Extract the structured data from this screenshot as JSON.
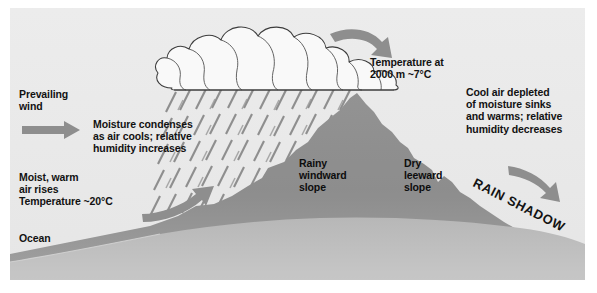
{
  "figure": {
    "background_color": "#ffffff",
    "panel_color": "#eeeeee",
    "mountain_color": "#8f8f8f",
    "foreground_color": "#b4b4b4",
    "arrow_color": "#8c8c8c",
    "cloud_color": "#fdfdfd",
    "rain_color": "#7d7d7d",
    "text_color": "#121212"
  },
  "labels": {
    "prevailing_wind": "Prevailing\nwind",
    "moisture_condenses": "Moisture condenses\nas air cools; relative\nhumidity increases",
    "moist_warm_air": "Moist, warm\nair rises\nTemperature ~20°C",
    "ocean": "Ocean",
    "temperature_2000m": "Temperature at\n2000 m ~7°C",
    "cool_air_depleted": "Cool air depleted\nof moisture sinks\nand warms; relative\nhumidity decreases",
    "rainy_windward_slope": "Rainy\nwindward\nslope",
    "dry_leeward_slope": "Dry\nleeward\nslope",
    "rain_shadow": "RAIN SHADOW"
  },
  "icons": {
    "wind_arrow": "right-arrow-icon",
    "rising_air_arrow": "curved-up-right-arrow-icon",
    "over_summit_arrow": "curved-down-right-arrow-icon",
    "descending_air_arrow": "down-right-arrow-icon",
    "cloud": "cumulus-cloud-icon",
    "rain": "rain-streaks-icon",
    "mountain": "mountain-icon",
    "ocean": "ocean-icon"
  }
}
